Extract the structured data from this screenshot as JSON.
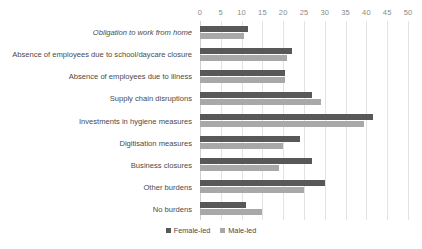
{
  "chart_data": {
    "type": "bar",
    "orientation": "horizontal",
    "title": "",
    "xlabel": "",
    "ylabel": "",
    "xlim": [
      0,
      50
    ],
    "xticks": [
      0,
      5,
      10,
      15,
      20,
      25,
      30,
      35,
      40,
      45,
      50
    ],
    "grid": true,
    "legend_position": "bottom",
    "categories": [
      "Obligation to work from home",
      "Absence of employees due to school/daycare closure",
      "Absence of employees due to illness",
      "Supply chain disruptions",
      "Investments in hygiene measures",
      "Digitisation measures",
      "Business closures",
      "Other burdens",
      "No burdens"
    ],
    "category_styles": [
      "italic",
      "normal",
      "normal",
      "normal",
      "normal",
      "normal",
      "normal",
      "normal",
      "normal"
    ],
    "series": [
      {
        "name": "Female-led",
        "color": "#585858",
        "values": [
          11.5,
          22.0,
          20.5,
          27.0,
          41.5,
          24.0,
          27.0,
          30.0,
          11.0
        ]
      },
      {
        "name": "Male-led",
        "color": "#a8a8a8",
        "values": [
          10.5,
          21.0,
          20.5,
          29.0,
          39.5,
          20.0,
          19.0,
          25.0,
          15.0
        ]
      }
    ]
  },
  "colors": {
    "female_led": "#585858",
    "male_led": "#a8a8a8",
    "gridline": "#e3e3e3",
    "tick_text": "#8a8a8a",
    "label_text": "#4a4a4a",
    "background": "#ffffff"
  }
}
